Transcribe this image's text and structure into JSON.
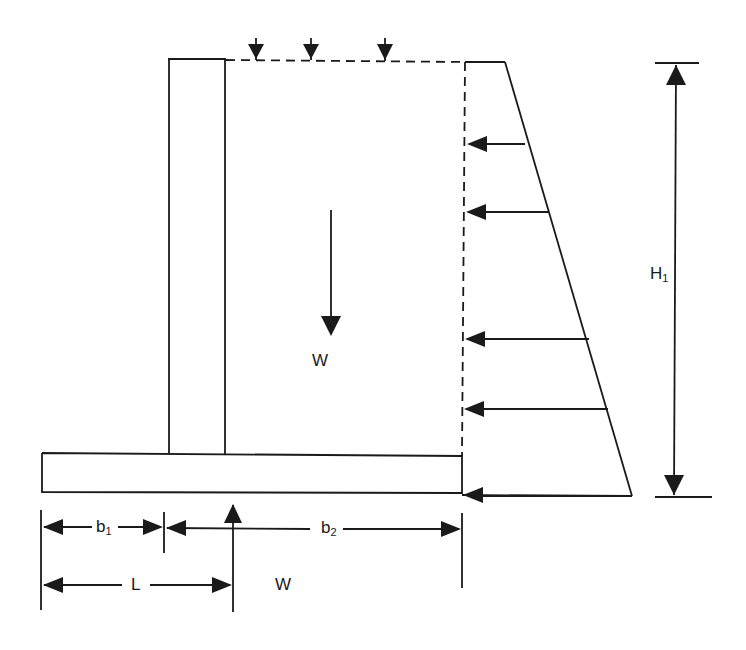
{
  "diagram": {
    "type": "retaining-wall-free-body-diagram",
    "colors": {
      "stroke": "#1a1a1a",
      "background": "#ffffff"
    },
    "labels": {
      "weight_soil": "W",
      "weight_reaction": "W",
      "height": {
        "base": "H",
        "sub": "1"
      },
      "toe_width": {
        "base": "b",
        "sub": "1"
      },
      "heel_width": {
        "base": "b",
        "sub": "2"
      },
      "lever_arm": "L"
    },
    "elements": {
      "stem": "vertical wall stem",
      "footing": "base slab",
      "backfill": "soil block above heel (dashed boundary)",
      "surcharge_arrows": 3,
      "lateral_pressure_arrows": 5,
      "pressure_distribution": "triangular earth pressure diagram"
    }
  }
}
